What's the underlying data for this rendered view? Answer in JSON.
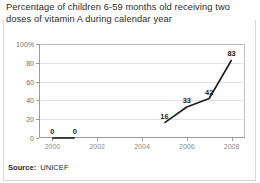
{
  "figure": {
    "title": "Percentage of children 6-59 months old receiving two doses of vitamin A during calendar year",
    "source_label": "Source:",
    "source_value": "UNICEF"
  },
  "chart_data": {
    "type": "line",
    "title": "Percentage of children 6-59 months old receiving two doses of vitamin A during calendar year",
    "xlabel": "",
    "ylabel": "",
    "xlim": [
      1999.4,
      2008.6
    ],
    "ylim": [
      0,
      100
    ],
    "grid": true,
    "legend": "none",
    "x_ticks": [
      "2000",
      "2002",
      "2004",
      "2006",
      "2008"
    ],
    "x_tick_values": [
      2000,
      2002,
      2004,
      2006,
      2008
    ],
    "y_ticks": [
      "0",
      "20",
      "40",
      "60",
      "80",
      "100%"
    ],
    "y_tick_values": [
      0,
      20,
      40,
      60,
      80,
      100
    ],
    "series": [
      {
        "name": "vitamin A two-dose coverage (early)",
        "x": [
          2000,
          2001
        ],
        "values": [
          0,
          0
        ],
        "labels": [
          "0",
          "0"
        ]
      },
      {
        "name": "vitamin A two-dose coverage (recent)",
        "x": [
          2005,
          2006,
          2007,
          2008
        ],
        "values": [
          16,
          33,
          42,
          83
        ],
        "labels": [
          "16",
          "33",
          "42",
          "83"
        ]
      }
    ],
    "line_color": "#1c1c1c",
    "grid_color": "#e2e2e2",
    "axis_color": "#9a9a9a"
  }
}
